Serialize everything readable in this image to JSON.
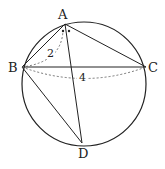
{
  "figure": {
    "type": "circle with inscribed quadrilateral",
    "points": {
      "A": {
        "label": "A",
        "x": 65,
        "y": 24
      },
      "B": {
        "label": "B",
        "x": 22,
        "y": 67
      },
      "C": {
        "label": "C",
        "x": 146,
        "y": 67
      },
      "D": {
        "label": "D",
        "x": 82,
        "y": 143
      }
    },
    "circle": {
      "cx": 84,
      "cy": 84,
      "r": 62
    },
    "segments": [
      "AB",
      "AC",
      "BC",
      "AD",
      "BD"
    ],
    "measurements": {
      "AB": "2",
      "BC": "4"
    },
    "angle_marks": "equal angles at A (BAD = DAC) marked with dots"
  }
}
